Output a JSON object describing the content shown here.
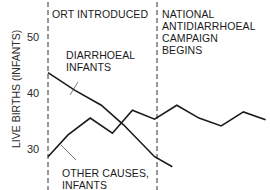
{
  "chart_data": {
    "type": "line",
    "title": "",
    "xlabel": "",
    "ylabel": "LIVE BIRTHS (INFANTS)",
    "ylim": [
      24,
      53
    ],
    "yticks": [
      30,
      40,
      50
    ],
    "grid": false,
    "x": [
      0,
      1,
      2,
      3,
      4,
      5,
      6,
      7,
      8,
      9,
      10
    ],
    "series": [
      {
        "name": "DIARRHOEAL INFANTS",
        "label_lines": [
          "DIARRHOEAL",
          "INFANTS"
        ],
        "x": [
          0,
          1.2,
          2.4,
          3.4,
          4.8,
          5.6
        ],
        "values": [
          43.8,
          40.7,
          38.0,
          34.5,
          28.8,
          27.0
        ]
      },
      {
        "name": "OTHER CAUSES, INFANTS",
        "label_lines": [
          "OTHER CAUSES,",
          "INFANTS"
        ],
        "x": [
          0,
          0.9,
          1.9,
          2.9,
          3.8,
          4.8,
          5.8,
          6.8,
          7.8,
          8.8,
          9.8
        ],
        "values": [
          28.8,
          32.7,
          35.7,
          33.0,
          37.1,
          35.5,
          38.0,
          35.7,
          34.3,
          36.8,
          35.4
        ]
      }
    ],
    "annotations": [
      {
        "x": 0,
        "type": "vline-dashed",
        "text_lines": [
          "ORT INTRODUCED"
        ]
      },
      {
        "x": 4.85,
        "type": "vline-dashed",
        "text_lines": [
          "NATIONAL",
          "ANTIDIARRHOEAL",
          "CAMPAIGN",
          "BEGINS"
        ]
      }
    ]
  },
  "labels": {
    "ylabel": "LIVE BIRTHS (INFANTS)",
    "tick_50": "50",
    "tick_40": "40",
    "tick_30": "30",
    "ort": "ORT INTRODUCED",
    "campaign_1": "NATIONAL",
    "campaign_2": "ANTIDIARRHOEAL",
    "campaign_3": "CAMPAIGN",
    "campaign_4": "BEGINS",
    "diarrhoeal_1": "DIARRHOEAL",
    "diarrhoeal_2": "INFANTS",
    "other_1": "OTHER CAUSES,",
    "other_2": "INFANTS"
  },
  "colors": {
    "line": "#1a1a1a",
    "text": "#1a1a1a",
    "background": "#ffffff"
  }
}
